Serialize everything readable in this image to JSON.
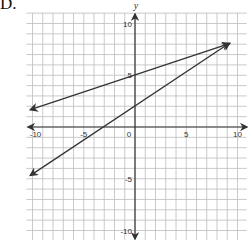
{
  "problem_label": "D.",
  "chart_data": {
    "type": "line",
    "title": "",
    "xlabel": "",
    "ylabel": "y",
    "xlim": [
      -10,
      10
    ],
    "ylim": [
      -10,
      10
    ],
    "grid": true,
    "x_ticks": [
      "-10",
      "-5",
      "0",
      "5",
      "10"
    ],
    "y_ticks": [
      "10",
      "5",
      "-5",
      "-10"
    ],
    "series": [
      {
        "name": "line-1",
        "equation": "y = (1/3)x + 5",
        "x": [
          -10,
          9
        ],
        "y": [
          1.67,
          8
        ],
        "color": "#333333"
      },
      {
        "name": "line-2",
        "equation": "y = (2/3)x + 2",
        "x": [
          -10,
          9
        ],
        "y": [
          -4.67,
          8
        ],
        "color": "#333333"
      }
    ],
    "intersection": [
      9,
      8
    ]
  }
}
